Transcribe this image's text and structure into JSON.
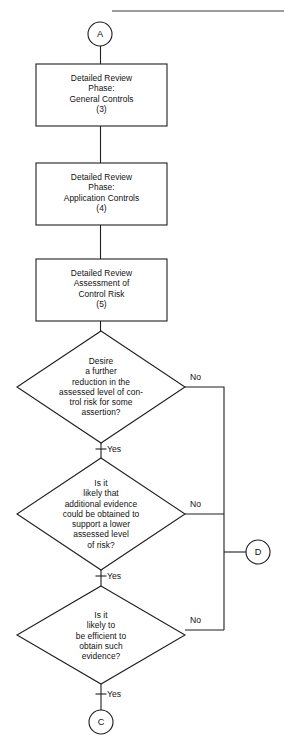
{
  "diagram": {
    "type": "flowchart",
    "page_rule": {
      "name": "top-horizontal-rule",
      "x1": 112,
      "x2": 284,
      "y": 11
    },
    "connectors": {
      "yes": "Yes",
      "no": "No"
    },
    "nodes": [
      {
        "id": "A",
        "kind": "connector-circle",
        "label": "A",
        "cx": 100,
        "cy": 34,
        "r": 12
      },
      {
        "id": "box-general-controls",
        "kind": "process",
        "text": "Detailed Review\nPhase:\nGeneral Controls\n(3)",
        "step": "(3)",
        "x": 36,
        "y": 64,
        "w": 131,
        "h": 62
      },
      {
        "id": "box-application-controls",
        "kind": "process",
        "text": "Detailed Review\nPhase:\nApplication Controls\n(4)",
        "step": "(4)",
        "x": 36,
        "y": 163,
        "w": 131,
        "h": 62
      },
      {
        "id": "box-assessment-control-risk",
        "kind": "process",
        "text": "Detailed Review\nAssessment of\nControl Risk\n(5)",
        "step": "(5)",
        "x": 36,
        "y": 259,
        "w": 131,
        "h": 62
      },
      {
        "id": "diamond-desire-further-reduction",
        "kind": "decision",
        "text": "Desire\na further\nreduction in the\nassessed level of con-\ntrol risk for some\nassertion?",
        "cx": 101,
        "cy": 387,
        "hw": 84,
        "hh": 56,
        "yes_label": "Yes",
        "no_label": "No"
      },
      {
        "id": "diamond-additional-evidence",
        "kind": "decision",
        "text": "Is it\nlikely that\nadditional evidence\ncould be obtained to\nsupport a lower\nassessed level\nof risk?",
        "cx": 101,
        "cy": 514,
        "hw": 84,
        "hh": 56,
        "yes_label": "Yes",
        "no_label": "No"
      },
      {
        "id": "diamond-efficient-obtain",
        "kind": "decision",
        "text": "Is it\nlikely to\nbe efficient to\nobtain such\nevidence?",
        "cx": 101,
        "cy": 635,
        "hw": 84,
        "hh": 49,
        "yes_label": "Yes",
        "no_label": "No"
      },
      {
        "id": "D",
        "kind": "connector-circle",
        "label": "D",
        "cx": 258,
        "cy": 552,
        "r": 12
      },
      {
        "id": "C",
        "kind": "connector-circle",
        "label": "C",
        "cx": 101,
        "cy": 722,
        "r": 12
      }
    ]
  }
}
